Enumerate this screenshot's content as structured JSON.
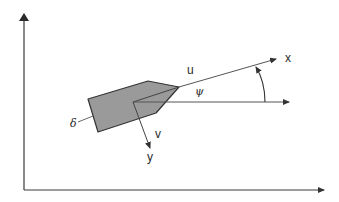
{
  "diagram": {
    "colors": {
      "axis": "#3a3a3a",
      "hull_fill": "#9a9a9a",
      "hull_stroke": "#333333",
      "line": "#555555",
      "text": "#2a2a2a"
    },
    "labels": {
      "surge_velocity": "u",
      "sway_velocity": "v",
      "body_x_axis": "x",
      "body_y_axis": "y",
      "heading_angle": "ψ",
      "rudder_angle": "δ"
    }
  }
}
